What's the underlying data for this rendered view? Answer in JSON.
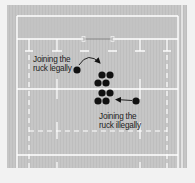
{
  "diagram": {
    "colors": {
      "page_background": "#f2f2f2",
      "field": "#c6c6c6",
      "field_stripe": "#bdbdbd",
      "lines": "#ffffff",
      "players": "#111111",
      "arrows": "#111111",
      "text": "#222222"
    },
    "annotations": [
      {
        "id": "legal",
        "line1": "Joining the",
        "line2": "ruck legally"
      },
      {
        "id": "illegal",
        "line1": "Joining the",
        "line2": "ruck illegally"
      }
    ],
    "players": {
      "ruck_cluster": [
        {
          "x": 102,
          "y": 75
        },
        {
          "x": 110,
          "y": 75
        },
        {
          "x": 98,
          "y": 83
        },
        {
          "x": 106,
          "y": 83
        },
        {
          "x": 102,
          "y": 93
        },
        {
          "x": 110,
          "y": 93
        },
        {
          "x": 98,
          "y": 101
        },
        {
          "x": 106,
          "y": 101
        }
      ],
      "legal_joiner": {
        "x": 77,
        "y": 70
      },
      "illegal_joiner": {
        "x": 136,
        "y": 101
      }
    }
  }
}
